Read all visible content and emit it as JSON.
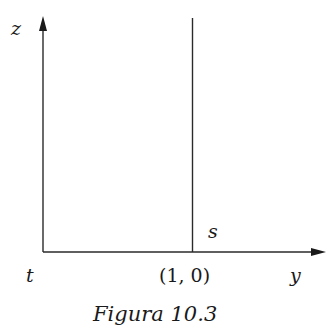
{
  "diagram": {
    "axes": {
      "vertical_label": "z",
      "horizontal_label": "y",
      "origin_label": "t"
    },
    "line": {
      "label": "s",
      "point_label": "(1, 0)"
    },
    "caption": "Figura 10.3",
    "colors": {
      "stroke": "#2a2a2a",
      "text": "#1a1a1a",
      "background": "#ffffff"
    }
  }
}
